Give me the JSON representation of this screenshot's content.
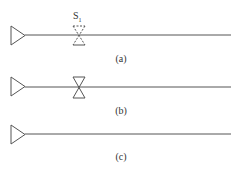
{
  "diagram": {
    "panels": [
      {
        "id": "a",
        "label": "(a)",
        "switch": {
          "present": true,
          "style": "dashed",
          "label": "S",
          "subscript": "1"
        }
      },
      {
        "id": "b",
        "label": "(b)",
        "switch": {
          "present": true,
          "style": "solid"
        }
      },
      {
        "id": "c",
        "label": "(c)",
        "switch": {
          "present": false
        }
      }
    ],
    "colors": {
      "stroke": "#555555",
      "background": "#ffffff"
    }
  }
}
